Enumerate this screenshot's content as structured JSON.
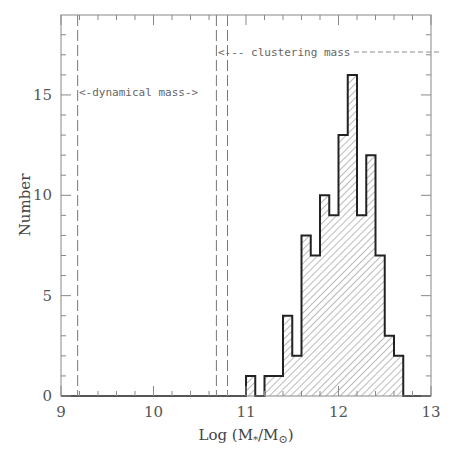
{
  "chart_data": {
    "type": "bar",
    "subtype": "histogram",
    "title": "",
    "xlabel": "Log (M*/M⊙)",
    "ylabel": "Number",
    "xlim": [
      9,
      13
    ],
    "ylim": [
      0,
      19
    ],
    "x_ticks": [
      9,
      10,
      11,
      12,
      13
    ],
    "x_tick_labels": [
      "9",
      "10",
      "11",
      "12",
      "13"
    ],
    "y_ticks": [
      0,
      5,
      10,
      15
    ],
    "y_tick_labels": [
      "0",
      "5",
      "10",
      "15"
    ],
    "grid": false,
    "legend": null,
    "bin_width": 0.1,
    "bin_edges_start": 11.0,
    "categories": [
      "11.0",
      "11.1",
      "11.2",
      "11.3",
      "11.4",
      "11.5",
      "11.6",
      "11.7",
      "11.8",
      "11.9",
      "12.0",
      "12.1",
      "12.2",
      "12.3",
      "12.4",
      "12.5",
      "12.6"
    ],
    "values": [
      1,
      0,
      1,
      1,
      4,
      2,
      8,
      7,
      10,
      9,
      13,
      16,
      9,
      12,
      7,
      3,
      2
    ],
    "fill": "diagonal hatch",
    "vertical_lines": [
      {
        "x": 9.18,
        "style": "dashed"
      },
      {
        "x": 10.68,
        "style": "dashed"
      },
      {
        "x": 10.8,
        "style": "dashed"
      }
    ],
    "annotations": [
      {
        "text": "<-dynamical mass->",
        "x": 9.2,
        "y": 15.2
      },
      {
        "text": "<--- clustering mass -----",
        "x": 10.7,
        "y": 17.1
      }
    ]
  },
  "labels": {
    "xlabel_prefix": "Log (M",
    "xlabel_sub": "*",
    "xlabel_mid": "/M",
    "xlabel_sun": "⊙",
    "xlabel_suffix": ")",
    "ylabel": "Number",
    "dyn_annot": "<-dynamical mass->",
    "clu_annot": "<--- clustering mass"
  }
}
